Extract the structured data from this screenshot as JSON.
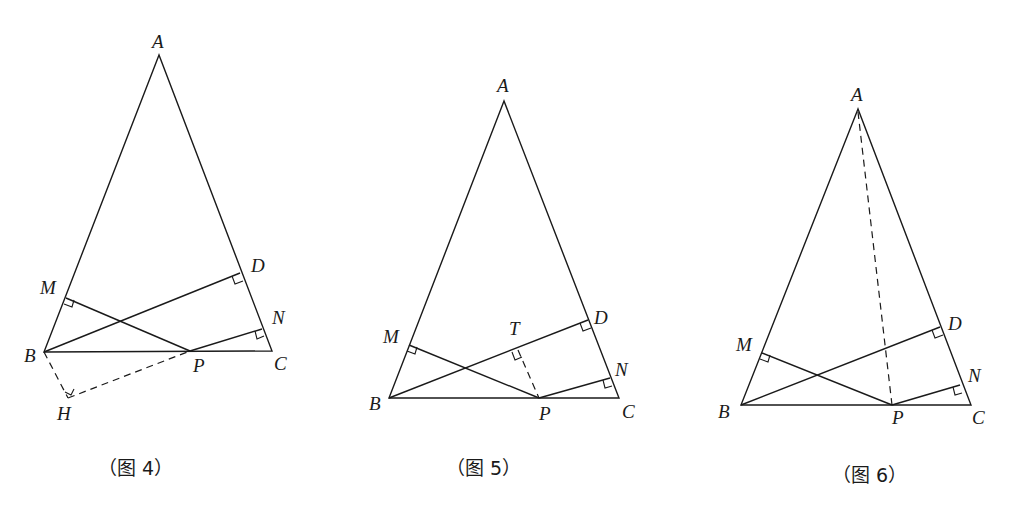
{
  "figures": [
    {
      "id": "fig4",
      "caption": "（图 4）",
      "points": {
        "A": [
          159,
          55
        ],
        "B": [
          44,
          352
        ],
        "C": [
          272,
          351
        ],
        "P": [
          190,
          351
        ],
        "D": [
          240,
          273
        ],
        "M": [
          66,
          298
        ],
        "N": [
          262,
          329
        ],
        "H": [
          68,
          398
        ]
      },
      "labels": {
        "A": "A",
        "B": "B",
        "C": "C",
        "P": "P",
        "D": "D",
        "M": "M",
        "N": "N",
        "H": "H"
      },
      "solid_segments": [
        "AB",
        "AC",
        "BC",
        "BD",
        "PM",
        "PN"
      ],
      "dashed_segments": [
        "BH",
        "HP"
      ],
      "right_angles": [
        "D",
        "M",
        "N",
        "H"
      ]
    },
    {
      "id": "fig5",
      "caption": "（图 5）",
      "points": {
        "A": [
          504,
          101
        ],
        "B": [
          389,
          398
        ],
        "C": [
          619,
          398
        ],
        "P": [
          539,
          398
        ],
        "D": [
          588,
          320
        ],
        "M": [
          409,
          345
        ],
        "N": [
          610,
          378
        ],
        "T": [
          518,
          350
        ]
      },
      "labels": {
        "A": "A",
        "B": "B",
        "C": "C",
        "P": "P",
        "D": "D",
        "M": "M",
        "N": "N",
        "T": "T"
      },
      "solid_segments": [
        "AB",
        "AC",
        "BC",
        "BD",
        "PM",
        "PN"
      ],
      "dashed_segments": [
        "PT"
      ],
      "right_angles": [
        "D",
        "M",
        "N",
        "T"
      ]
    },
    {
      "id": "fig6",
      "caption": "（图 6）",
      "points": {
        "A": [
          858,
          109
        ],
        "B": [
          741,
          405
        ],
        "C": [
          971,
          405
        ],
        "P": [
          892,
          405
        ],
        "D": [
          940,
          327
        ],
        "M": [
          762,
          353
        ],
        "N": [
          960,
          385
        ]
      },
      "labels": {
        "A": "A",
        "B": "B",
        "C": "C",
        "P": "P",
        "D": "D",
        "M": "M",
        "N": "N"
      },
      "solid_segments": [
        "AB",
        "AC",
        "BC",
        "BD",
        "PM",
        "PN"
      ],
      "dashed_segments": [
        "AP"
      ],
      "right_angles": [
        "D",
        "M",
        "N"
      ]
    }
  ]
}
